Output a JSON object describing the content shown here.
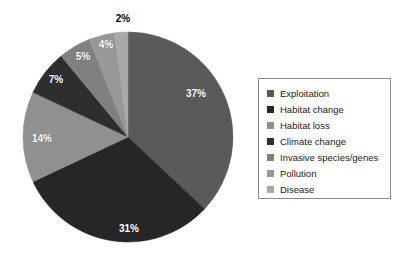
{
  "chart_data": {
    "type": "pie",
    "title": "",
    "labels": [
      "Exploitation",
      "Habitat change",
      "Habitat loss",
      "Climate change",
      "Invasive species/genes",
      "Pollution",
      "Disease"
    ],
    "values": [
      37,
      31,
      14,
      7,
      5,
      4,
      2
    ],
    "value_labels": [
      "37%",
      "31%",
      "14%",
      "7%",
      "5%",
      "4%",
      "2%"
    ],
    "colors": [
      "#5a5a5a",
      "#262626",
      "#909090",
      "#2e2e2e",
      "#808080",
      "#979797",
      "#a8a8a8"
    ],
    "start_angle_deg": 0,
    "direction": "clockwise",
    "legend_position": "right",
    "legend_border": true,
    "grid": false,
    "background": "#ffffff",
    "label_color_inside": "#ffffff",
    "label_color_outside": "#000000",
    "geometry": {
      "center_x": 128,
      "center_y": 137,
      "radius": 105
    },
    "slices": [
      {
        "label": "Exploitation",
        "value": 37,
        "value_label": "37%",
        "color": "#5a5a5a",
        "label_x": 196,
        "label_y": 93,
        "outside": false
      },
      {
        "label": "Habitat change",
        "value": 31,
        "value_label": "31%",
        "color": "#262626",
        "label_x": 129,
        "label_y": 228,
        "outside": false
      },
      {
        "label": "Habitat loss",
        "value": 14,
        "value_label": "14%",
        "color": "#909090",
        "label_x": 42,
        "label_y": 138,
        "outside": false
      },
      {
        "label": "Climate change",
        "value": 7,
        "value_label": "7%",
        "color": "#2e2e2e",
        "label_x": 56,
        "label_y": 79,
        "outside": false
      },
      {
        "label": "Invasive species/genes",
        "value": 5,
        "value_label": "5%",
        "color": "#808080",
        "label_x": 83,
        "label_y": 56,
        "outside": false
      },
      {
        "label": "Pollution",
        "value": 4,
        "value_label": "4%",
        "color": "#979797",
        "label_x": 106,
        "label_y": 44,
        "outside": false
      },
      {
        "label": "Disease",
        "value": 2,
        "value_label": "2%",
        "color": "#a8a8a8",
        "label_x": 123,
        "label_y": 18,
        "outside": true
      }
    ]
  }
}
